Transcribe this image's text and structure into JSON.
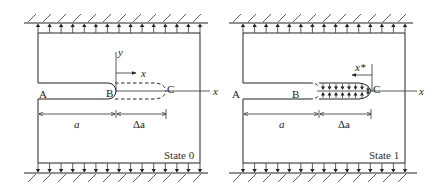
{
  "figure": {
    "panels": [
      {
        "id": "state0",
        "state_label": "State 0",
        "points": {
          "A": "A",
          "B": "B",
          "C": "C"
        },
        "axes": {
          "y_label": "y",
          "x_label": "x",
          "far_x_label": "x"
        },
        "dims": {
          "a": "a",
          "delta_a": "Δa"
        },
        "crack_extension_style": "dashed"
      },
      {
        "id": "state1",
        "state_label": "State 1",
        "points": {
          "A": "A",
          "B": "B",
          "C": "C"
        },
        "axes": {
          "x_star_label": "x*",
          "far_x_label": "x"
        },
        "dims": {
          "a": "a",
          "delta_a": "Δa"
        },
        "crack_extension_style": "closing tractions"
      }
    ],
    "boundary": {
      "top_load": "uniform traction (arrows up), fixed wall",
      "bottom_load": "uniform traction (arrows down), fixed wall",
      "arrow_count": 15
    },
    "colors": {
      "line": "#222222",
      "background": "#ffffff"
    }
  }
}
